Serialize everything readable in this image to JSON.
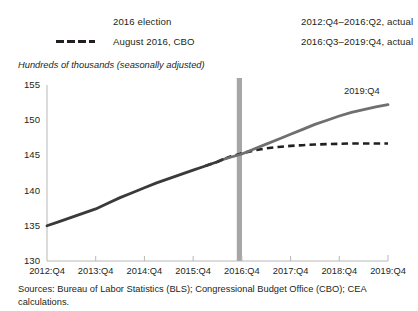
{
  "legend": {
    "items": [
      {
        "label": "2016 election",
        "swatch": "gray-bar-swatch",
        "color": "#a6a6a6"
      },
      {
        "label": "August 2016, CBO",
        "swatch": "dashed-line-swatch",
        "color": "#231f20"
      },
      {
        "label": "2012:Q4–2016:Q2, actual",
        "swatch": "solid-dark-line-swatch",
        "color": "#3a3a3a"
      },
      {
        "label": "2016:Q3–2019:Q4, actual",
        "swatch": "solid-gray-line-swatch",
        "color": "#6f6f6f"
      }
    ]
  },
  "axis_label": "Hundreds of thousands (seasonally adjusted)",
  "annotation": "2019:Q4",
  "source_note": "Sources: Bureau of Labor Statistics (BLS); Congressional Budget Office (CBO); CEA calculations.",
  "chart_data": {
    "type": "line",
    "title": "",
    "subtitle": "",
    "xlabel": "",
    "ylabel": "Hundreds of thousands (seasonally adjusted)",
    "ylim": [
      130,
      155
    ],
    "yticks": [
      130,
      135,
      140,
      145,
      150,
      155
    ],
    "xlim": [
      "2012:Q4",
      "2019:Q4"
    ],
    "xticks": [
      "2012:Q4",
      "2013:Q4",
      "2014:Q4",
      "2015:Q4",
      "2016:Q4",
      "2017:Q4",
      "2018:Q4",
      "2019:Q4"
    ],
    "grid": false,
    "legend_position": "top",
    "annotations": [
      {
        "text": "2019:Q4",
        "x": "2019:Q4",
        "y": 152.2
      }
    ],
    "vertical_marker": {
      "label": "2016 election",
      "x": "2016:Q4",
      "x_value": 2016.85,
      "color": "#a6a6a6"
    },
    "series": [
      {
        "name": "2012:Q4–2016:Q2, actual",
        "color": "#3a3a3a",
        "style": "solid",
        "x": [
          2012.9,
          2013.15,
          2013.4,
          2013.65,
          2013.9,
          2014.15,
          2014.4,
          2014.65,
          2014.9,
          2015.15,
          2015.4,
          2015.65,
          2015.9,
          2016.15,
          2016.4,
          2016.5
        ],
        "values": [
          135.0,
          135.6,
          136.2,
          136.8,
          137.4,
          138.2,
          139.0,
          139.7,
          140.4,
          141.1,
          141.7,
          142.3,
          142.9,
          143.5,
          144.1,
          144.4
        ]
      },
      {
        "name": "2016:Q3–2019:Q4, actual",
        "color": "#6f6f6f",
        "style": "solid",
        "x": [
          2016.5,
          2016.65,
          2016.9,
          2017.15,
          2017.4,
          2017.65,
          2017.9,
          2018.15,
          2018.4,
          2018.65,
          2018.9,
          2019.15,
          2019.4,
          2019.65,
          2019.9
        ],
        "values": [
          144.4,
          144.7,
          145.2,
          145.9,
          146.6,
          147.3,
          148.0,
          148.7,
          149.4,
          150.0,
          150.6,
          151.1,
          151.5,
          151.9,
          152.2
        ]
      },
      {
        "name": "August 2016, CBO",
        "color": "#231f20",
        "style": "dashed",
        "x": [
          2016.15,
          2016.4,
          2016.65,
          2016.9,
          2017.15,
          2017.4,
          2017.65,
          2017.9,
          2018.15,
          2018.4,
          2018.65,
          2018.9,
          2019.15,
          2019.4,
          2019.65,
          2019.9
        ],
        "values": [
          143.5,
          144.1,
          144.8,
          145.3,
          145.7,
          146.0,
          146.2,
          146.35,
          146.45,
          146.55,
          146.6,
          146.65,
          146.7,
          146.7,
          146.7,
          146.7
        ]
      }
    ]
  }
}
